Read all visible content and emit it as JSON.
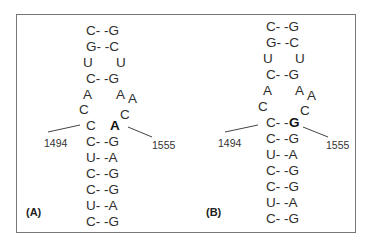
{
  "panels": [
    {
      "label": "(A)",
      "stem_top": [
        "C- -G",
        "G- -C"
      ],
      "internal_loop_row": [
        "U",
        "U"
      ],
      "stem_mid": "C- -G",
      "loop_left": [
        "A",
        "C"
      ],
      "loop_right": [
        "A",
        "A",
        "C"
      ],
      "junction_left": "C",
      "junction_right": "A",
      "junction_right_bold": true,
      "stem_bottom": [
        "C- -G",
        "U- -A",
        "C- -G",
        "C- -G",
        "U- -A",
        "C- -G"
      ],
      "left_position": "1494",
      "right_position": "1555"
    },
    {
      "label": "(B)",
      "stem_top": [
        "C- -G",
        "G- -C"
      ],
      "internal_loop_row": [
        "U",
        "U"
      ],
      "stem_mid": "C- -G",
      "loop_left": [
        "A",
        "C"
      ],
      "loop_right": [
        "A",
        "A",
        "C"
      ],
      "junction_left": "C- -",
      "junction_right": "G",
      "junction_right_bold": true,
      "stem_bottom": [
        "C- -G",
        "U- -A",
        "C- -G",
        "C- -G",
        "U- -A",
        "C- -G"
      ],
      "left_position": "1494",
      "right_position": "1555"
    }
  ]
}
